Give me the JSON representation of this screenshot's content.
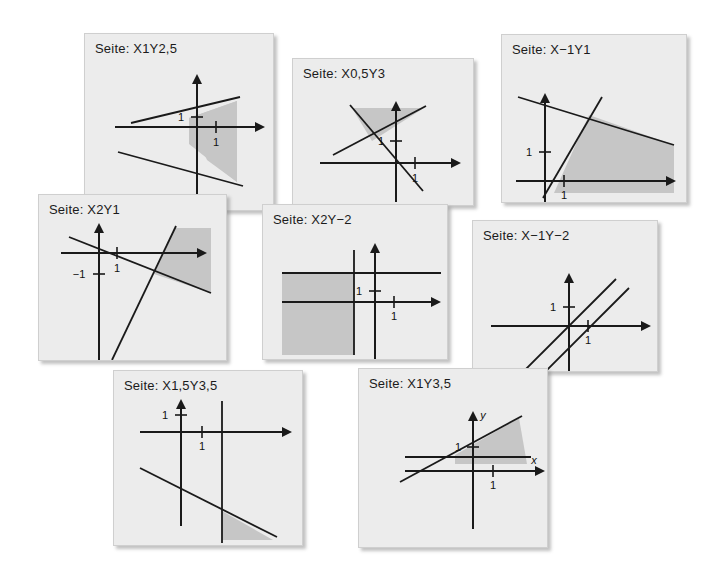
{
  "page": {
    "background_color": "#ffffff",
    "panel_background_color": "#ececec",
    "panel_border_color": "#cfcfcf",
    "shade_color": "#c6c6c6",
    "line_color": "#1a1a1a",
    "panel_count": 8
  },
  "panels": [
    {
      "id": "x1y2-5",
      "title": "Seite: X1Y2,5",
      "x": 84,
      "y": 33,
      "w": 190,
      "h": 178,
      "tick_labels": [
        "1",
        "1"
      ],
      "axis_labels": [],
      "shaded": true,
      "lines": 2,
      "origin": {
        "x": 112,
        "y": 93
      },
      "description": "two crossing lines with shaded wedge right of y-axis"
    },
    {
      "id": "x0-5y3",
      "title": "Seite: X0,5Y3",
      "x": 292,
      "y": 58,
      "w": 182,
      "h": 148,
      "tick_labels": [
        "1",
        "1"
      ],
      "axis_labels": [],
      "shaded": true,
      "lines": 2,
      "origin": {
        "x": 103,
        "y": 104
      },
      "description": "two crossing lines with shaded triangle above intersection"
    },
    {
      "id": "x-1y1",
      "title": "Seite: X−1Y1",
      "x": 501,
      "y": 34,
      "w": 186,
      "h": 169,
      "tick_labels": [
        "1",
        "1"
      ],
      "axis_labels": [],
      "shaded": true,
      "lines": 2,
      "origin": {
        "x": 43,
        "y": 146
      },
      "description": "steep rising line and shallow falling line, shaded region between them"
    },
    {
      "id": "x2y1",
      "title": "Seite: X2Y1",
      "x": 38,
      "y": 194,
      "w": 189,
      "h": 167,
      "tick_labels": [
        "1",
        "−1"
      ],
      "axis_labels": [],
      "shaded": true,
      "lines": 2,
      "origin": {
        "x": 60,
        "y": 58
      },
      "description": "falling line and steep rising line, shaded wedge at top right"
    },
    {
      "id": "x2y-2",
      "title": "Seite: X2Y−2",
      "x": 262,
      "y": 204,
      "w": 186,
      "h": 156,
      "tick_labels": [
        "1",
        "1"
      ],
      "axis_labels": [],
      "shaded": true,
      "lines": 2,
      "origin": {
        "x": 112,
        "y": 97
      },
      "description": "vertical line and horizontal line bounding a shaded lower-left quadrant"
    },
    {
      "id": "x-1y-2",
      "title": "Seite: X−1Y−2",
      "x": 472,
      "y": 220,
      "w": 186,
      "h": 152,
      "tick_labels": [
        "1",
        "1"
      ],
      "axis_labels": [],
      "shaded": false,
      "lines": 2,
      "origin": {
        "x": 96,
        "y": 105
      },
      "description": "two parallel rising lines, no shaded region"
    },
    {
      "id": "x1-5y3-5",
      "title": "Seite: X1,5Y3,5",
      "x": 113,
      "y": 370,
      "w": 190,
      "h": 176,
      "tick_labels": [
        "1",
        "1"
      ],
      "axis_labels": [],
      "shaded": true,
      "lines": 2,
      "origin": {
        "x": 67,
        "y": 61
      },
      "description": "vertical line and falling line with small shaded triangle bottom right"
    },
    {
      "id": "x1y3-5",
      "title": "Seite: X1Y3,5",
      "x": 358,
      "y": 368,
      "w": 190,
      "h": 180,
      "tick_labels": [
        "1",
        "1"
      ],
      "axis_labels": [
        "y",
        "x"
      ],
      "shaded": true,
      "lines": 2,
      "origin": {
        "x": 114,
        "y": 100
      },
      "description": "rising line and horizontal line with shaded wedge, axes labelled x and y"
    }
  ]
}
